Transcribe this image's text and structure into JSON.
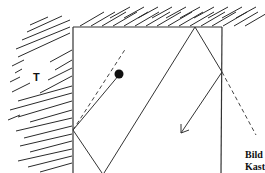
{
  "diagram": {
    "region_label": "T",
    "caption_line1": "Bild",
    "caption_line2": "Kast",
    "elements": {
      "wall": "hatched-wall",
      "table": "table-box",
      "ball": "ball",
      "trajectory": "ball-trajectory",
      "extension_lines": "dashed-mirror-lines",
      "direction_arrow": "arrow"
    },
    "colors": {
      "ink": "#333333",
      "background": "#ffffff"
    }
  }
}
